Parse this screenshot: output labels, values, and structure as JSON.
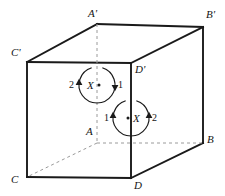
{
  "figure": {
    "background_color": "#ffffff",
    "line_color": "#1a1a1a",
    "hidden_line_color": "#9a9a9a",
    "vertices": [
      {
        "id": "A-prime",
        "label": "A'",
        "x": 97,
        "y": 24,
        "label_x": 88,
        "label_y": 8,
        "hidden": false
      },
      {
        "id": "B-prime",
        "label": "B'",
        "x": 203,
        "y": 27,
        "label_x": 206,
        "label_y": 9,
        "hidden": false
      },
      {
        "id": "C-prime",
        "label": "C'",
        "x": 27,
        "y": 62,
        "label_x": 11,
        "label_y": 47,
        "hidden": false
      },
      {
        "id": "D-prime",
        "label": "D'",
        "x": 131,
        "y": 63,
        "label_x": 135,
        "label_y": 64,
        "hidden": false
      },
      {
        "id": "A",
        "label": "A",
        "x": 97,
        "y": 143,
        "label_x": 86,
        "label_y": 126,
        "hidden": true
      },
      {
        "id": "B",
        "label": "B",
        "x": 203,
        "y": 143,
        "label_x": 207,
        "label_y": 134,
        "hidden": false
      },
      {
        "id": "C",
        "label": "C",
        "x": 27,
        "y": 177,
        "label_x": 11,
        "label_y": 174,
        "hidden": false
      },
      {
        "id": "D",
        "label": "D",
        "x": 131,
        "y": 178,
        "label_x": 134,
        "label_y": 180,
        "hidden": false
      }
    ],
    "edges": [
      {
        "id": "edge-Cp-Dp",
        "from": "C-prime",
        "to": "D-prime",
        "style": "solid"
      },
      {
        "id": "edge-Dp-D",
        "from": "D-prime",
        "to": "D",
        "style": "solid"
      },
      {
        "id": "edge-D-C",
        "from": "D",
        "to": "C",
        "style": "solid"
      },
      {
        "id": "edge-C-Cp",
        "from": "C",
        "to": "C-prime",
        "style": "solid"
      },
      {
        "id": "edge-Ap-Bp",
        "from": "A-prime",
        "to": "B-prime",
        "style": "solid"
      },
      {
        "id": "edge-Bp-B",
        "from": "B-prime",
        "to": "B",
        "style": "solid"
      },
      {
        "id": "edge-Cp-Ap",
        "from": "C-prime",
        "to": "A-prime",
        "style": "solid"
      },
      {
        "id": "edge-Dp-Bp",
        "from": "D-prime",
        "to": "B-prime",
        "style": "solid"
      },
      {
        "id": "edge-D-B",
        "from": "D",
        "to": "B",
        "style": "solid"
      },
      {
        "id": "edge-Ap-A",
        "from": "A-prime",
        "to": "A",
        "style": "dashed"
      },
      {
        "id": "edge-A-B",
        "from": "A",
        "to": "B",
        "style": "dashed"
      },
      {
        "id": "edge-A-C",
        "from": "A",
        "to": "C",
        "style": "dashed"
      }
    ],
    "loops": [
      {
        "id": "loop-upper",
        "center_x": 97,
        "center_y": 85,
        "radius": 18,
        "point_label": "X",
        "point_label_x": 87,
        "point_label_y": 80,
        "dot_x": 99,
        "dot_y": 85,
        "left_number": "2",
        "left_number_x": 69,
        "left_number_y": 80,
        "right_number": "1",
        "right_number_y": 80,
        "right_number_x": 118,
        "left_arrow_direction": "up",
        "right_arrow_direction": "down"
      },
      {
        "id": "loop-lower",
        "center_x": 131,
        "center_y": 118,
        "radius": 18,
        "point_label": "X",
        "point_label_x": 133,
        "point_label_y": 113,
        "dot_x": 128,
        "dot_y": 118,
        "left_number": "1",
        "left_number_x": 104,
        "left_number_y": 113,
        "right_number": "2",
        "right_number_x": 152,
        "right_number_y": 113,
        "left_arrow_direction": "up",
        "right_arrow_direction": "up"
      }
    ]
  }
}
